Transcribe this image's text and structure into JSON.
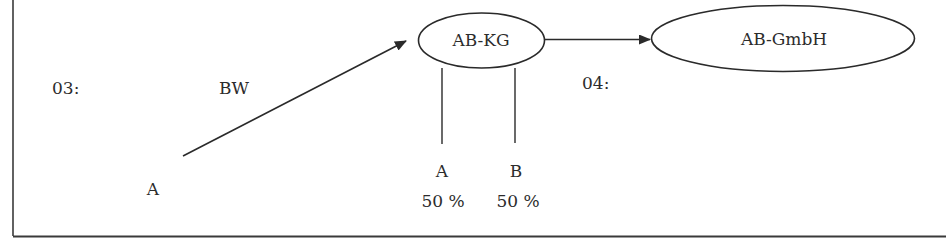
{
  "diagram": {
    "nodes": {
      "kg": {
        "label": "AB-KG"
      },
      "gmbh": {
        "label": "AB-GmbH"
      }
    },
    "steps": {
      "step03": "03:",
      "step04": "04:"
    },
    "transfer": {
      "label": "BW",
      "from": "A"
    },
    "shareholders": [
      {
        "name": "A",
        "share": "50 %"
      },
      {
        "name": "B",
        "share": "50 %"
      }
    ],
    "colors": {
      "stroke": "#2a2a2a",
      "background": "#ffffff"
    }
  }
}
